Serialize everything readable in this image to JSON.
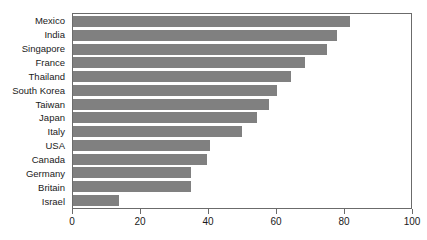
{
  "chart_data": {
    "type": "bar",
    "orientation": "horizontal",
    "title": "",
    "subtitle": "",
    "xlabel": "",
    "ylabel": "",
    "xlim": [
      0,
      100
    ],
    "xticks": [
      0,
      20,
      40,
      60,
      80,
      100
    ],
    "grid": false,
    "legend": null,
    "bar_color": "#808080",
    "axis_color": "#6b6b6b",
    "categories": [
      "Mexico",
      "India",
      "Singapore",
      "France",
      "Thailand",
      "South Korea",
      "Taiwan",
      "Japan",
      "Italy",
      "USA",
      "Canada",
      "Germany",
      "Britain",
      "Israel"
    ],
    "values": [
      82,
      78,
      75,
      68.5,
      64.5,
      60.5,
      58,
      54.5,
      50,
      40.5,
      39.5,
      35,
      35,
      13.5
    ]
  }
}
